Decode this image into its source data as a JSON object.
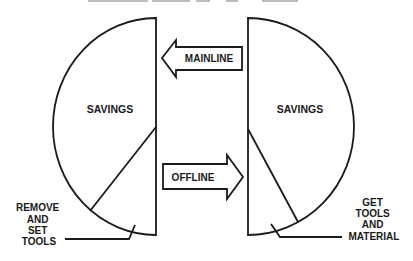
{
  "diagram": {
    "title_clipped": true,
    "colors": {
      "ink": "#1a1a1a",
      "background": "#ffffff"
    },
    "left_chart": {
      "savings_label": "SAVINGS",
      "slice_label_lines": [
        "REMOVE",
        "AND",
        "SET",
        "TOOLS"
      ]
    },
    "right_chart": {
      "savings_label": "SAVINGS",
      "slice_label_lines": [
        "GET",
        "TOOLS",
        "AND",
        "MATERIAL"
      ]
    },
    "arrows": {
      "mainline": {
        "label": "MAINLINE",
        "direction": "left"
      },
      "offline": {
        "label": "OFFLINE",
        "direction": "right"
      }
    }
  }
}
